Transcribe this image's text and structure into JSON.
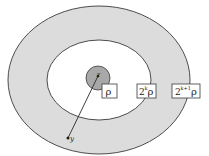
{
  "diagram": {
    "colors": {
      "annulus": "#dcdcdc",
      "inner_disk": "#ffffff",
      "center_ball": "#a8a8a8",
      "stroke": "#3a3a3a",
      "box_fill": "#ffffff"
    },
    "points": {
      "center_label": "z",
      "outer_point_label": "y"
    },
    "boxes": [
      {
        "base": "ρ",
        "exp": ""
      },
      {
        "base": "2",
        "exp": "k",
        "tail": "ρ"
      },
      {
        "base": "2",
        "exp": "k+1",
        "tail": "ρ"
      }
    ]
  }
}
